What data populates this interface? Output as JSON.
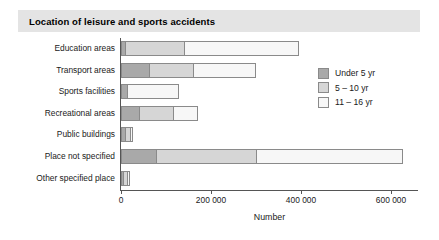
{
  "header": {
    "title": "Location of leisure and sports accidents"
  },
  "chart_data": {
    "type": "bar",
    "orientation": "horizontal",
    "stacked": true,
    "title": "Location of leisure and sports accidents",
    "xlabel": "Number",
    "ylabel": "",
    "xlim": [
      0,
      660000
    ],
    "grid": false,
    "legend_position": "upper-right",
    "xticks": [
      0,
      200000,
      400000,
      600000
    ],
    "xtick_labels": [
      "0",
      "200 000",
      "400 000",
      "600 000"
    ],
    "categories": [
      "Education areas",
      "Transport areas",
      "Sports facilities",
      "Recreational areas",
      "Public buildings",
      "Place not specified",
      "Other specified place"
    ],
    "series": [
      {
        "name": "Under 5 yr",
        "color": "#a9a9a9",
        "values": [
          10000,
          65000,
          15000,
          43000,
          10000,
          80000,
          5000
        ]
      },
      {
        "name": "5 – 10 yr",
        "color": "#d6d6d6",
        "values": [
          135000,
          100000,
          0,
          77000,
          15000,
          225000,
          10000
        ]
      },
      {
        "name": "11 – 16 yr",
        "color": "#f7f7f7",
        "values": [
          255000,
          140000,
          115000,
          55000,
          5000,
          325000,
          5000
        ]
      }
    ],
    "totals": [
      400000,
      305000,
      130000,
      175000,
      30000,
      630000,
      20000
    ]
  },
  "legend": {
    "items": [
      {
        "label": "Under 5 yr"
      },
      {
        "label": "5 – 10 yr"
      },
      {
        "label": "11 – 16 yr"
      }
    ]
  }
}
